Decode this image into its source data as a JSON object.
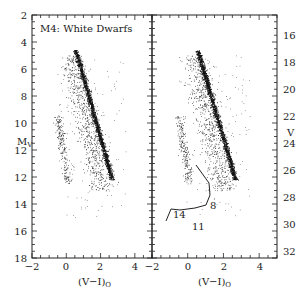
{
  "chart_data": {
    "type": "scatter",
    "title": "M4: White Dwarfs",
    "panels": [
      {
        "name": "left",
        "xlabel": "(V-I)0",
        "ylabel": "Mv",
        "xlim": [
          -2,
          5
        ],
        "ylim": [
          20,
          2
        ],
        "xticks": [
          -2,
          0,
          2,
          4
        ],
        "yticks": [
          2,
          4,
          6,
          8,
          10,
          12,
          14,
          16,
          18,
          20
        ],
        "annotation": "M4: White Dwarfs",
        "description": "Color-magnitude diagram of M4: main sequence from (0.6,5) to (2.6,14); white dwarf sequence near (-0.3..0.5, 10..14)"
      },
      {
        "name": "right",
        "xlabel": "(V-I)0",
        "ylabel": "V",
        "xlim": [
          -2,
          5
        ],
        "ylim": [
          32.5,
          14.5
        ],
        "xticks": [
          -2,
          0,
          2,
          4
        ],
        "yticks": [
          16,
          18,
          20,
          22,
          24,
          26,
          28,
          30,
          32
        ],
        "isochrone": {
          "labels": [
            "8",
            "11",
            "14"
          ],
          "points": [
            [
              0.2,
              23.5
            ],
            [
              0.8,
              27.0
            ],
            [
              1.2,
              28.3
            ],
            [
              1.2,
              29.2
            ],
            [
              0.6,
              29.8
            ],
            [
              0.0,
              29.9
            ],
            [
              -0.6,
              29.7
            ],
            [
              -0.9,
              31.0
            ]
          ]
        }
      }
    ],
    "legend": [],
    "grid": false
  },
  "labels": {
    "title": "M4: White Dwarfs",
    "xlabel": "(V−I)",
    "xsub": "O",
    "ylabel_left": "M",
    "ylabel_left_sub": "V",
    "ylabel_right": "V",
    "iso_8": "8",
    "iso_11": "11",
    "iso_14": "14",
    "yticks_left": [
      "2",
      "4",
      "6",
      "8",
      "10",
      "12",
      "14",
      "16",
      "18",
      "20"
    ],
    "yticks_right": [
      "16",
      "18",
      "20",
      "22",
      "24",
      "26",
      "28",
      "30",
      "32"
    ],
    "xticks": [
      "−2",
      "0",
      "2",
      "4"
    ]
  }
}
